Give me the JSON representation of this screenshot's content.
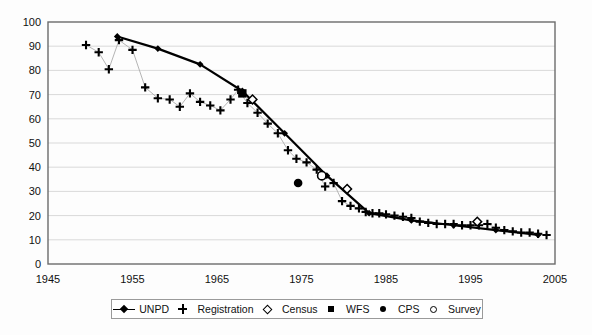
{
  "chart_data": {
    "type": "line",
    "title": "",
    "xlabel": "",
    "ylabel": "",
    "xlim": [
      1945,
      2005
    ],
    "ylim": [
      0,
      100
    ],
    "xticks": [
      1945,
      1955,
      1965,
      1975,
      1985,
      1995,
      2005
    ],
    "yticks": [
      0,
      10,
      20,
      30,
      40,
      50,
      60,
      70,
      80,
      90,
      100
    ],
    "grid": "horizontal",
    "legend_position": "bottom",
    "series": [
      {
        "name": "UNPD",
        "marker": "filled-diamond",
        "line": true,
        "color": "#000000",
        "points": [
          [
            1953.2,
            94.0
          ],
          [
            1958.0,
            89.0
          ],
          [
            1963.0,
            82.5
          ],
          [
            1968.0,
            71.5
          ],
          [
            1973.0,
            54.0
          ],
          [
            1978.0,
            36.5
          ],
          [
            1983.0,
            21.0
          ],
          [
            1988.0,
            18.0
          ],
          [
            1993.0,
            16.0
          ],
          [
            1998.0,
            14.0
          ],
          [
            2003.0,
            12.0
          ]
        ]
      },
      {
        "name": "Registration",
        "marker": "plus",
        "line": "thin-grey",
        "color": "#000000",
        "points": [
          [
            1949.5,
            90.5
          ],
          [
            1951.0,
            87.5
          ],
          [
            1952.2,
            80.5
          ],
          [
            1953.4,
            92.5
          ],
          [
            1955.0,
            88.5
          ],
          [
            1956.5,
            73.0
          ],
          [
            1958.0,
            68.5
          ],
          [
            1959.4,
            68.0
          ],
          [
            1960.6,
            65.0
          ],
          [
            1961.8,
            70.5
          ],
          [
            1963.0,
            67.0
          ],
          [
            1964.2,
            65.5
          ],
          [
            1965.4,
            63.5
          ],
          [
            1966.6,
            68.0
          ],
          [
            1967.5,
            72.0
          ],
          [
            1968.6,
            66.5
          ],
          [
            1969.8,
            62.5
          ],
          [
            1971.0,
            58.0
          ],
          [
            1972.2,
            54.0
          ],
          [
            1973.4,
            47.0
          ],
          [
            1974.4,
            43.5
          ],
          [
            1975.6,
            42.0
          ],
          [
            1976.8,
            39.0
          ],
          [
            1977.8,
            32.0
          ],
          [
            1978.8,
            33.5
          ],
          [
            1979.8,
            26.0
          ],
          [
            1980.8,
            24.0
          ],
          [
            1981.8,
            23.0
          ],
          [
            1982.6,
            21.5
          ],
          [
            1983.4,
            21.0
          ],
          [
            1984.2,
            21.0
          ],
          [
            1985.0,
            20.5
          ],
          [
            1986.0,
            20.0
          ],
          [
            1987.0,
            19.5
          ],
          [
            1988.0,
            19.0
          ],
          [
            1989.0,
            17.5
          ],
          [
            1990.0,
            17.0
          ],
          [
            1991.0,
            16.5
          ],
          [
            1992.0,
            16.5
          ],
          [
            1993.0,
            16.5
          ],
          [
            1994.0,
            16.0
          ],
          [
            1995.0,
            16.0
          ],
          [
            1996.0,
            16.0
          ],
          [
            1997.0,
            16.5
          ],
          [
            1998.0,
            15.0
          ],
          [
            1999.0,
            14.0
          ],
          [
            2000.0,
            13.5
          ],
          [
            2001.0,
            13.0
          ],
          [
            2002.0,
            13.0
          ],
          [
            2003.0,
            12.5
          ],
          [
            2004.0,
            12.0
          ]
        ]
      },
      {
        "name": "Census",
        "marker": "open-diamond",
        "line": false,
        "color": "#000000",
        "points": [
          [
            1969.2,
            68.0
          ],
          [
            1980.4,
            31.0
          ],
          [
            1995.8,
            17.5
          ]
        ]
      },
      {
        "name": "WFS",
        "marker": "filled-square",
        "line": false,
        "color": "#000000",
        "points": [
          [
            1968.0,
            70.5
          ]
        ]
      },
      {
        "name": "CPS",
        "marker": "filled-circle",
        "line": false,
        "color": "#000000",
        "points": [
          [
            1974.6,
            33.5
          ]
        ]
      },
      {
        "name": "Survey",
        "marker": "open-circle",
        "line": false,
        "color": "#000000",
        "points": [
          [
            1977.4,
            36.5
          ]
        ]
      }
    ]
  },
  "legend": {
    "items": [
      {
        "label": "UNPD",
        "marker": "line-diamond"
      },
      {
        "label": "Registration",
        "marker": "plus"
      },
      {
        "label": "Census",
        "marker": "open-diamond"
      },
      {
        "label": "WFS",
        "marker": "filled-square"
      },
      {
        "label": "CPS",
        "marker": "filled-circle"
      },
      {
        "label": "Survey",
        "marker": "open-circle"
      }
    ]
  },
  "axes": {
    "x_tick_labels": [
      "1945",
      "1955",
      "1965",
      "1975",
      "1985",
      "1995",
      "2005"
    ],
    "y_tick_labels": [
      "0",
      "10",
      "20",
      "30",
      "40",
      "50",
      "60",
      "70",
      "80",
      "90",
      "100"
    ]
  },
  "colors": {
    "axis": "#6b6b6b",
    "grid": "#d9d9d9",
    "series": "#000000",
    "thin_line": "#b5b5b5"
  }
}
